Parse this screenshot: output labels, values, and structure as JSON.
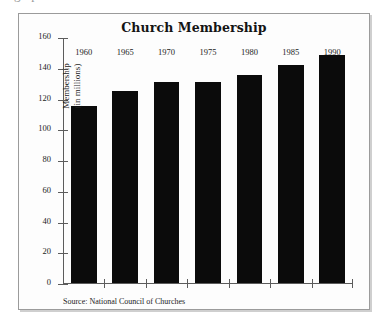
{
  "page": {
    "clipped_header_text": "graph"
  },
  "figure": {
    "title": "Church Membership",
    "source_note": "Source: National Council of Churches",
    "ylabel_line1": "Membership",
    "ylabel_line2": "(in millions)",
    "bar_color": "#0b0b0b",
    "axis_color": "#5c5c5c",
    "frame_color": "#9b9b9b"
  },
  "chart_data": {
    "type": "bar",
    "title": "Church Membership",
    "xlabel": "",
    "ylabel": "Membership (in millions)",
    "categories": [
      "1960",
      "1965",
      "1970",
      "1975",
      "1980",
      "1985",
      "1990"
    ],
    "values": [
      115,
      125,
      131,
      131,
      135,
      142,
      148
    ],
    "ylim": [
      0,
      160
    ],
    "ytick_labels": [
      "0",
      "20",
      "40",
      "60",
      "80",
      "100",
      "120",
      "140",
      "160"
    ],
    "ytick_values": [
      0,
      20,
      40,
      60,
      80,
      100,
      120,
      140,
      160
    ],
    "grid": false,
    "legend": false,
    "annotations": [
      "Source: National Council of Churches"
    ]
  }
}
